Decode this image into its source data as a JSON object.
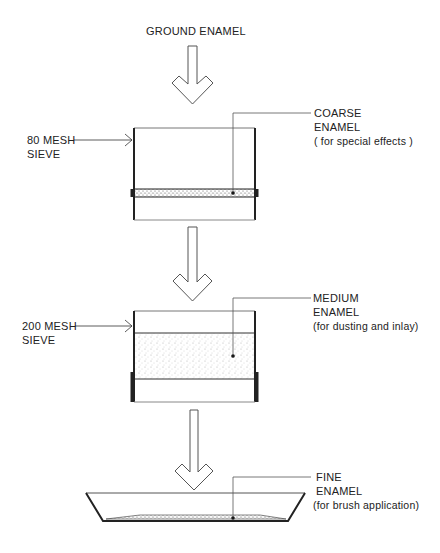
{
  "title": "GROUND ENAMEL",
  "sieves": [
    {
      "label_line1": "80 MESH",
      "label_line2": "SIEVE"
    },
    {
      "label_line1": "200 MESH",
      "label_line2": "SIEVE"
    }
  ],
  "outputs": [
    {
      "line1": "COARSE",
      "line2": "ENAMEL",
      "line3": "( for special effects )"
    },
    {
      "line1": "MEDIUM",
      "line2": "ENAMEL",
      "line3": "(for dusting and inlay)"
    },
    {
      "line1": "FINE",
      "line2": "ENAMEL",
      "line3": "(for brush application)"
    }
  ],
  "colors": {
    "ink": "#222222",
    "light_line": "#888888"
  }
}
